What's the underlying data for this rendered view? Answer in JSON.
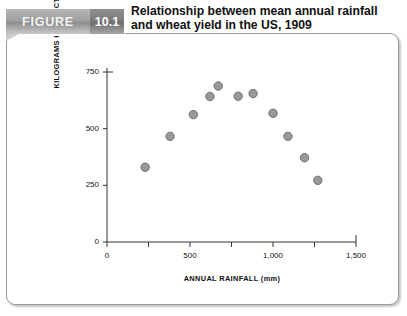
{
  "banner": {
    "figure_label": "FIGURE",
    "figure_number": "10.1"
  },
  "title": {
    "line1": "Relationship between mean annual rainfall",
    "line2": "and wheat yield in the US, 1909"
  },
  "chart_data": {
    "type": "scatter",
    "title": "Relationship between mean annual rainfall and wheat yield in the US, 1909",
    "xlabel": "ANNUAL RAINFALL (mm)",
    "ylabel": "KILOGRAMS PER HECTARE",
    "xlim": [
      0,
      1500
    ],
    "ylim": [
      0,
      750
    ],
    "xticks": [
      0,
      250,
      500,
      750,
      1000,
      1250,
      1500
    ],
    "xticklabels": [
      "0",
      "",
      "500",
      "",
      "1,000",
      "",
      "1,500"
    ],
    "yticks": [
      0,
      250,
      500,
      750
    ],
    "yticklabels": [
      "0",
      "250",
      "500",
      "750"
    ],
    "grid": false,
    "legend": null,
    "marker_color": "#999999",
    "marker_edge_color": "#666666",
    "points": [
      {
        "x": 230,
        "y": 330
      },
      {
        "x": 380,
        "y": 466
      },
      {
        "x": 520,
        "y": 562
      },
      {
        "x": 620,
        "y": 642
      },
      {
        "x": 670,
        "y": 688
      },
      {
        "x": 790,
        "y": 643
      },
      {
        "x": 880,
        "y": 655
      },
      {
        "x": 1000,
        "y": 568
      },
      {
        "x": 1090,
        "y": 466
      },
      {
        "x": 1190,
        "y": 372
      },
      {
        "x": 1270,
        "y": 272
      }
    ]
  }
}
